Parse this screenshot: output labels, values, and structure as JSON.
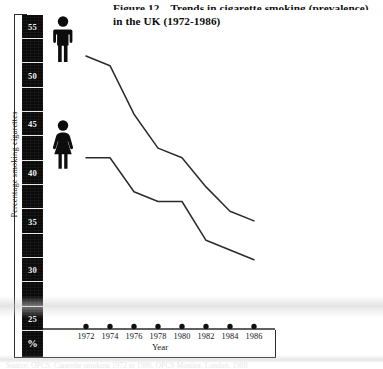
{
  "figure": {
    "number_label": "Figure 12",
    "title_line1": "Trends in cigarette smoking (prevalence)",
    "title_line2": "in the UK (1972-1986)",
    "source_note": "Source: OPCS, Cigarette smoking 1972 to 1986, OPCS Monitor, London, 1988"
  },
  "axes": {
    "y_caption": "Percentage smoking cigarettes",
    "x_caption": "Year",
    "y_tick_labels": [
      "55",
      "50",
      "45",
      "40",
      "35",
      "30",
      "25"
    ],
    "y_unit_label": "%",
    "x_tick_labels": [
      "1972",
      "1974",
      "1976",
      "1978",
      "1980",
      "1982",
      "1984",
      "1986"
    ]
  },
  "legend": {
    "male_icon": "male-pictogram-icon",
    "female_icon": "female-pictogram-icon"
  },
  "colors": {
    "line": "#2b2b2b",
    "axis_strip": "#0a0a0a",
    "tick_label": "#f2f2f2",
    "frame": "#2b2b2b",
    "background": "#ffffff"
  },
  "chart_data": {
    "type": "line",
    "xlabel": "Year",
    "ylabel": "Percentage smoking cigarettes",
    "x": [
      1972,
      1974,
      1976,
      1978,
      1980,
      1982,
      1984,
      1986
    ],
    "xlim": [
      1972,
      1986
    ],
    "ylim": [
      25,
      57
    ],
    "yticks": [
      25,
      30,
      35,
      40,
      45,
      50,
      55
    ],
    "grid": false,
    "legend_position": "inline-pictograms-left",
    "series": [
      {
        "name": "Men",
        "icon": "male-pictogram-icon",
        "values": [
          52.0,
          51.0,
          46.0,
          42.5,
          41.5,
          38.5,
          36.0,
          35.0
        ]
      },
      {
        "name": "Women",
        "icon": "female-pictogram-icon",
        "values": [
          41.5,
          41.5,
          38.0,
          37.0,
          37.0,
          33.0,
          32.0,
          31.0
        ]
      }
    ]
  },
  "geometry": {
    "plot_left": 86,
    "plot_right": 254,
    "y_top_value": 57.0,
    "y_top_px": 7.5,
    "y_px_per_unit": 9.7
  }
}
